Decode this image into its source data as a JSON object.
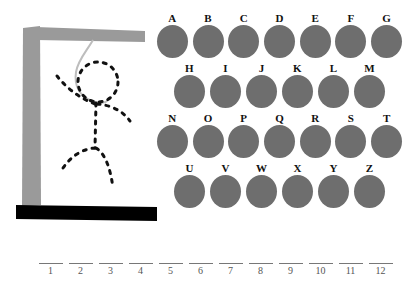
{
  "game": {
    "title": "Hangman",
    "background_color": "#ffffff"
  },
  "gallows": {
    "name": "hangman-gallows",
    "post_color": "#9a9a9a",
    "beam_color": "#9a9a9a",
    "base_color": "#000000",
    "rope_color": "#b8b8b8",
    "figure_color": "#111111",
    "figure_style": "dashed-outline",
    "parts_shown": [
      "post",
      "beam",
      "base",
      "rope",
      "head",
      "body",
      "left-arm",
      "right-arm",
      "left-leg",
      "right-leg"
    ]
  },
  "alphabet": {
    "disc_color": "#6e6e6e",
    "label_color": "#111111",
    "rows": [
      {
        "indented": false,
        "letters": [
          "A",
          "B",
          "C",
          "D",
          "E",
          "F",
          "G"
        ]
      },
      {
        "indented": true,
        "letters": [
          "H",
          "I",
          "J",
          "K",
          "L",
          "M"
        ]
      },
      {
        "indented": false,
        "letters": [
          "N",
          "O",
          "P",
          "Q",
          "R",
          "S",
          "T"
        ]
      },
      {
        "indented": true,
        "letters": [
          "U",
          "V",
          "W",
          "X",
          "Y",
          "Z"
        ]
      }
    ]
  },
  "word": {
    "length": 12,
    "slots": [
      {
        "number": "1",
        "letter": ""
      },
      {
        "number": "2",
        "letter": ""
      },
      {
        "number": "3",
        "letter": ""
      },
      {
        "number": "4",
        "letter": ""
      },
      {
        "number": "5",
        "letter": ""
      },
      {
        "number": "6",
        "letter": ""
      },
      {
        "number": "7",
        "letter": ""
      },
      {
        "number": "8",
        "letter": ""
      },
      {
        "number": "9",
        "letter": ""
      },
      {
        "number": "10",
        "letter": ""
      },
      {
        "number": "11",
        "letter": ""
      },
      {
        "number": "12",
        "letter": ""
      }
    ]
  }
}
